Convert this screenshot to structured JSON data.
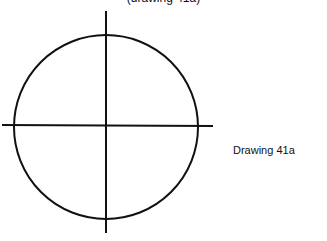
{
  "header": {
    "cropped_text": "(drawing 41a)"
  },
  "figure": {
    "label": "Drawing 41a",
    "circle": {
      "cx": 106,
      "cy": 127,
      "r": 92
    },
    "vertical_line": {
      "x": 106,
      "y1": 11,
      "y2": 233
    },
    "horizontal_line": {
      "y": 125,
      "x1": 2,
      "x2": 213
    },
    "stroke_color": "#111111"
  }
}
